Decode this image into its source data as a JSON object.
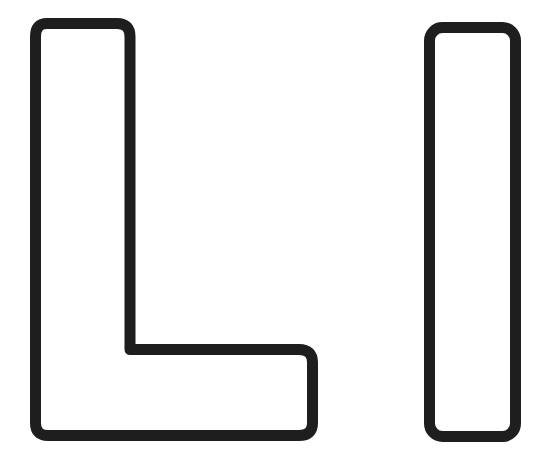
{
  "figure": {
    "letters": [
      "L",
      "I"
    ],
    "stroke_color": "#1e1e1e",
    "fill_color": "#ffffff",
    "background": "#ffffff"
  }
}
